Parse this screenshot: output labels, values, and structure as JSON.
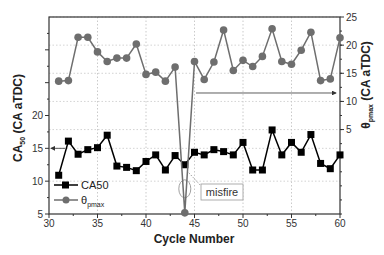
{
  "chart_data": {
    "type": "line",
    "title": "",
    "xlabel": "Cycle Number",
    "ylabel_left": "CA50 (CA aTDC)",
    "ylabel_left_main": "CA",
    "ylabel_left_sub": "50",
    "ylabel_left_rest": " (CA aTDC)",
    "ylabel_right": "θpmax (CA aTDC)",
    "ylabel_right_main": "θ",
    "ylabel_right_sub": "pmax",
    "ylabel_right_rest": " (CA aTDC)",
    "xlim": [
      30,
      60
    ],
    "ylim_left": [
      5,
      35
    ],
    "ylim_right": [
      -10,
      25
    ],
    "x_ticks": [
      30,
      35,
      40,
      45,
      50,
      55,
      60
    ],
    "y_ticks_left": [
      5,
      10,
      15,
      20
    ],
    "y_ticks_right": [
      5,
      10,
      15,
      20,
      25
    ],
    "grid": true,
    "legend_position": "lower-left",
    "x": [
      31,
      32,
      33,
      34,
      35,
      36,
      37,
      38,
      39,
      40,
      41,
      42,
      43,
      44,
      45,
      46,
      47,
      48,
      49,
      50,
      51,
      52,
      53,
      54,
      55,
      56,
      57,
      58,
      59,
      60
    ],
    "series": [
      {
        "name": "CA50",
        "axis": "left",
        "marker": "square",
        "color": "#000000",
        "values": [
          10.9,
          16.1,
          14.1,
          14.8,
          15.1,
          17.0,
          12.3,
          12.1,
          11.6,
          13.0,
          14.0,
          11.7,
          13.9,
          12.5,
          14.4,
          14.0,
          14.8,
          14.5,
          14.0,
          15.9,
          11.7,
          11.7,
          17.8,
          14.0,
          15.9,
          14.4,
          17.1,
          12.7,
          11.9,
          14.0
        ]
      },
      {
        "name": "θpmax",
        "name_main": "θ",
        "name_sub": "pmax",
        "axis": "right",
        "marker": "circle",
        "color": "#6e6e6e",
        "values": [
          13.6,
          13.7,
          21.4,
          21.4,
          18.8,
          17.1,
          17.7,
          17.7,
          20.2,
          14.8,
          15.2,
          13.6,
          16.1,
          -9.8,
          17.1,
          13.9,
          17.0,
          22.7,
          15.5,
          17.3,
          16.2,
          18.0,
          22.9,
          17.1,
          16.6,
          19.1,
          22.3,
          13.7,
          14.0,
          21.3
        ]
      }
    ],
    "annotations": [
      {
        "text": "misfire",
        "x": 44,
        "note": "callout box pointing to cycle 44 points"
      },
      {
        "text": "",
        "type": "arrow",
        "note": "left-pointing arrow at CA50 ≈ 15 indicating left axis"
      },
      {
        "text": "",
        "type": "arrow",
        "note": "right-pointing arrow at θpmax ≈ 11.5 indicating right axis"
      }
    ]
  }
}
